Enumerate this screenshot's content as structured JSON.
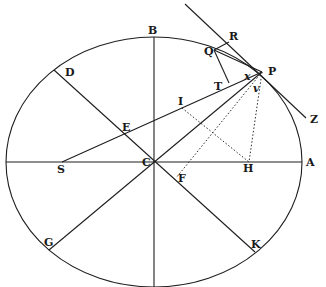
{
  "diagram": {
    "type": "geometric-construction",
    "ellipse": {
      "cx": 154,
      "cy": 162,
      "rx": 148,
      "ry": 125
    },
    "points": {
      "A": {
        "x": 303,
        "y": 162,
        "lx": 306,
        "ly": 166
      },
      "B": {
        "x": 154,
        "y": 38,
        "lx": 148,
        "ly": 34
      },
      "C": {
        "x": 154,
        "y": 162,
        "lx": 142,
        "ly": 166
      },
      "D": {
        "x": 54,
        "y": 70,
        "lx": 65,
        "ly": 76
      },
      "E": {
        "x": 124,
        "y": 134,
        "lx": 122,
        "ly": 131
      },
      "F": {
        "x": 176,
        "y": 178,
        "lx": 178,
        "ly": 182
      },
      "G": {
        "x": 49,
        "y": 250,
        "lx": 44,
        "ly": 246
      },
      "H": {
        "x": 249,
        "y": 162,
        "lx": 243,
        "ly": 172
      },
      "I": {
        "x": 182,
        "y": 108,
        "lx": 178,
        "ly": 105
      },
      "K": {
        "x": 255,
        "y": 252,
        "lx": 251,
        "ly": 248
      },
      "P": {
        "x": 262,
        "y": 72,
        "lx": 268,
        "ly": 75
      },
      "Q": {
        "x": 214,
        "y": 50,
        "lx": 204,
        "ly": 55
      },
      "R": {
        "x": 229,
        "y": 42,
        "lx": 229,
        "ly": 40
      },
      "S": {
        "x": 62,
        "y": 162,
        "lx": 57,
        "ly": 173
      },
      "T": {
        "x": 229,
        "y": 83,
        "lx": 214,
        "ly": 90
      },
      "Z": {
        "x": 306,
        "y": 118,
        "lx": 310,
        "ly": 123
      },
      "x": {
        "x": 248,
        "y": 77,
        "lx": 244,
        "ly": 80
      },
      "v": {
        "x": 256,
        "y": 88,
        "lx": 253,
        "ly": 92
      }
    },
    "labels": [
      "A",
      "B",
      "C",
      "D",
      "E",
      "F",
      "G",
      "H",
      "I",
      "K",
      "P",
      "Q",
      "R",
      "S",
      "T",
      "Z",
      "x",
      "v"
    ]
  }
}
